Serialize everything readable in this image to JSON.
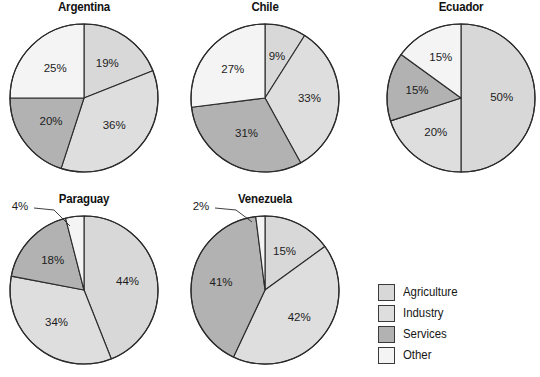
{
  "figure": {
    "background": "#ffffff",
    "stroke_color": "#2b2b2b"
  },
  "legend": {
    "position": "bottom-right",
    "x": 378,
    "y": 283,
    "items": [
      {
        "label": "Agriculture",
        "color": "#d8d8d8"
      },
      {
        "label": "Industry",
        "color": "#dedede"
      },
      {
        "label": "Services",
        "color": "#b2b2b2"
      },
      {
        "label": "Other",
        "color": "#f4f4f4"
      }
    ]
  },
  "chart_data": [
    {
      "type": "pie",
      "title": "Argentina",
      "legend_position": "bottom-right",
      "center": [
        84,
        98
      ],
      "radius": 74,
      "start_angle": 0,
      "direction": "clockwise",
      "labels": [
        "Agriculture",
        "Industry",
        "Services",
        "Other"
      ],
      "values": [
        19,
        36,
        20,
        25
      ],
      "value_labels": [
        "19%",
        "36%",
        "20%",
        "25%"
      ],
      "colors": [
        "#d8d8d8",
        "#dedede",
        "#b2b2b2",
        "#f4f4f4"
      ],
      "label_radius_factor": [
        0.56,
        0.56,
        0.55,
        0.55
      ]
    },
    {
      "type": "pie",
      "title": "Chile",
      "legend_position": "bottom-right",
      "center": [
        265,
        98
      ],
      "radius": 74,
      "start_angle": 0,
      "direction": "clockwise",
      "labels": [
        "Agriculture",
        "Industry",
        "Services",
        "Other"
      ],
      "values": [
        9,
        33,
        31,
        27
      ],
      "value_labels": [
        "9%",
        "33%",
        "31%",
        "27%"
      ],
      "colors": [
        "#d8d8d8",
        "#dedede",
        "#b2b2b2",
        "#f4f4f4"
      ],
      "label_radius_factor": [
        0.58,
        0.6,
        0.55,
        0.58
      ]
    },
    {
      "type": "pie",
      "title": "Ecuador",
      "legend_position": "bottom-right",
      "center": [
        461,
        98
      ],
      "radius": 74,
      "start_angle": 0,
      "direction": "clockwise",
      "labels": [
        "Agriculture",
        "Industry",
        "Services",
        "Other"
      ],
      "values": [
        50,
        20,
        15,
        15
      ],
      "value_labels": [
        "50%",
        "20%",
        "15%",
        "15%"
      ],
      "colors": [
        "#d8d8d8",
        "#dedede",
        "#b2b2b2",
        "#f4f4f4"
      ],
      "label_radius_factor": [
        0.55,
        0.58,
        0.6,
        0.6
      ]
    },
    {
      "type": "pie",
      "title": "Paraguay",
      "legend_position": "bottom-right",
      "center": [
        84,
        290
      ],
      "radius": 74,
      "start_angle": 0,
      "direction": "clockwise",
      "labels": [
        "Agriculture",
        "Industry",
        "Services",
        "Other"
      ],
      "values": [
        44,
        34,
        18,
        4
      ],
      "value_labels": [
        "44%",
        "34%",
        "18%",
        "4%"
      ],
      "colors": [
        "#d8d8d8",
        "#dedede",
        "#b2b2b2",
        "#f4f4f4"
      ],
      "label_radius_factor": [
        0.6,
        0.58,
        0.58,
        0.0
      ],
      "callouts": [
        {
          "index": 3,
          "text": "4%",
          "label_x": 20,
          "label_y": 207,
          "line_to_x": 70,
          "line_to_y": 226
        }
      ]
    },
    {
      "type": "pie",
      "title": "Venezuela",
      "legend_position": "bottom-right",
      "center": [
        265,
        290
      ],
      "radius": 74,
      "start_angle": 0,
      "direction": "clockwise",
      "labels": [
        "Agriculture",
        "Industry",
        "Services",
        "Other"
      ],
      "values": [
        15,
        42,
        41,
        2
      ],
      "value_labels": [
        "15%",
        "42%",
        "41%",
        "2%"
      ],
      "colors": [
        "#d8d8d8",
        "#dedede",
        "#b2b2b2",
        "#f4f4f4"
      ],
      "label_radius_factor": [
        0.58,
        0.6,
        0.6,
        0.0
      ],
      "callouts": [
        {
          "index": 3,
          "text": "2%",
          "label_x": 201,
          "label_y": 207,
          "line_to_x": 252,
          "line_to_y": 222
        }
      ]
    }
  ]
}
